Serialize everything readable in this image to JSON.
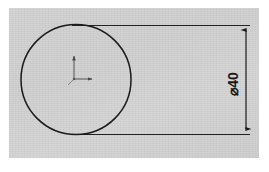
{
  "drawing": {
    "type": "cad-technical-drawing",
    "title": "",
    "sheet": {
      "background_color": "#d0d0d0",
      "border_color": "#ffffff"
    },
    "line_color": "#1a1a1a",
    "geometry": {
      "circle": {
        "name": "main-circle",
        "center_x": 76,
        "center_y": 79,
        "radius": 55,
        "stroke_width": 1.4
      },
      "origin_marker": {
        "name": "origin-triad",
        "x": 74,
        "y": 79,
        "y_axis_length": 26,
        "x_axis_length": 22,
        "label": ""
      },
      "extension_lines": [
        {
          "name": "extension-line-top",
          "x1": 76,
          "y1": 25,
          "x2": 250,
          "y2": 25
        },
        {
          "name": "extension-line-bottom",
          "x1": 76,
          "y1": 134,
          "x2": 250,
          "y2": 134
        }
      ],
      "dimension_line": {
        "name": "diameter-dimension-line",
        "x": 246,
        "y1": 25,
        "y2": 134,
        "arrow_style": "filled-closed",
        "orientation": "vertical"
      }
    },
    "annotations": [
      {
        "name": "diameter-dimension-label",
        "symbol": "⌀",
        "value": "40",
        "text": "⌀40",
        "rotation_deg": -90,
        "x": 233,
        "y": 84
      }
    ]
  },
  "dimension": {
    "label": "⌀40",
    "symbol": "⌀",
    "value": "40"
  }
}
